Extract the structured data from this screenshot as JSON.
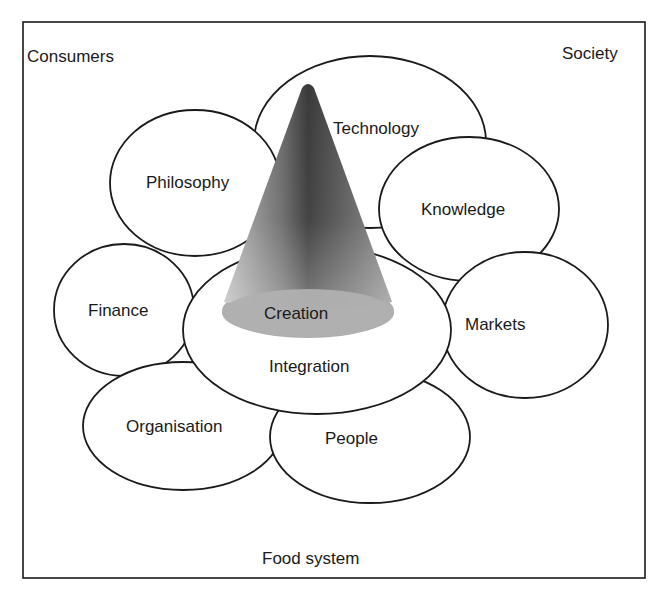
{
  "diagram": {
    "corner_labels": {
      "top_left": "Consumers",
      "top_right": "Society",
      "bottom": "Food system"
    },
    "nodes": [
      {
        "id": "technology",
        "label": "Technology"
      },
      {
        "id": "philosophy",
        "label": "Philosophy"
      },
      {
        "id": "knowledge",
        "label": "Knowledge"
      },
      {
        "id": "finance",
        "label": "Finance"
      },
      {
        "id": "markets",
        "label": "Markets"
      },
      {
        "id": "organisation",
        "label": "Organisation"
      },
      {
        "id": "people",
        "label": "People"
      },
      {
        "id": "integration",
        "label": "Integration"
      }
    ],
    "cone": {
      "label": "Creation"
    },
    "colors": {
      "stroke": "#1a1a1a",
      "fill": "#ffffff",
      "cone_dark": "#3c3c3c",
      "cone_light": "#b4b4b4",
      "cone_base": "#a8a8a8"
    }
  }
}
